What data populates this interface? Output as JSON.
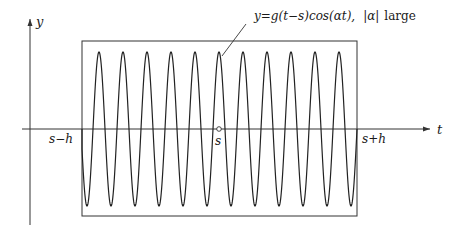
{
  "figure": {
    "axes": {
      "x_label": "t",
      "y_label": "y"
    },
    "ticks": {
      "left": "s−h",
      "center": "s",
      "right": "s+h"
    },
    "annotation": {
      "formula": "y=g(t−s)cos(αt),",
      "condition_prefix": "|α|",
      "condition_word": "large"
    },
    "colors": {
      "stroke": "#333333",
      "background": "#ffffff"
    },
    "curve": {
      "description": "rapidly oscillating cosine windowed by a box function on [s-h, s+h]",
      "peak_count": 11,
      "window": [
        "s-h",
        "s+h"
      ],
      "center_marker": "open-circle at s"
    }
  }
}
